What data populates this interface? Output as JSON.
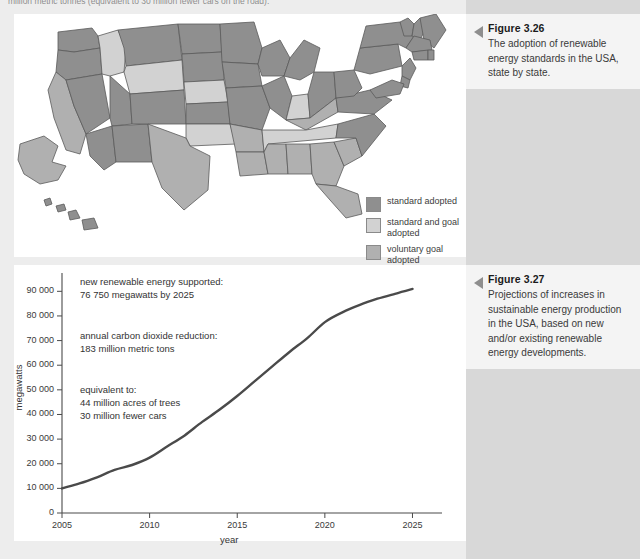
{
  "page": {
    "running_header": "million metric tonnes (equivalent to 30 million fewer cars on the road).",
    "bg_color": "#ededed",
    "sidebar_color": "#d8d8d8"
  },
  "figure_326": {
    "number": "Figure 3.26",
    "caption": "The adoption of renewable energy standards in the USA, state by state.",
    "legend": [
      {
        "label": "standard adopted",
        "color": "#8f8f8f"
      },
      {
        "label": "standard and goal adopted",
        "color": "#d2d2d2"
      },
      {
        "label": "voluntary goal adopted",
        "color": "#b0b0b0"
      }
    ],
    "map_colors": {
      "standard": "#8f8f8f",
      "standard_and_goal": "#d2d2d2",
      "voluntary_goal": "#b0b0b0",
      "outline": "#5a5a5a"
    },
    "states": [
      {
        "code": "WA",
        "category": "standard"
      },
      {
        "code": "OR",
        "category": "standard"
      },
      {
        "code": "CA",
        "category": "voluntary_goal"
      },
      {
        "code": "NV",
        "category": "standard"
      },
      {
        "code": "ID",
        "category": "standard_and_goal"
      },
      {
        "code": "MT",
        "category": "standard"
      },
      {
        "code": "WY",
        "category": "standard_and_goal"
      },
      {
        "code": "UT",
        "category": "standard"
      },
      {
        "code": "AZ",
        "category": "standard"
      },
      {
        "code": "NM",
        "category": "standard"
      },
      {
        "code": "CO",
        "category": "standard"
      },
      {
        "code": "ND",
        "category": "standard"
      },
      {
        "code": "SD",
        "category": "standard"
      },
      {
        "code": "NE",
        "category": "standard_and_goal"
      },
      {
        "code": "KS",
        "category": "standard"
      },
      {
        "code": "OK",
        "category": "standard_and_goal"
      },
      {
        "code": "TX",
        "category": "voluntary_goal"
      },
      {
        "code": "MN",
        "category": "standard"
      },
      {
        "code": "IA",
        "category": "standard"
      },
      {
        "code": "MO",
        "category": "standard"
      },
      {
        "code": "AR",
        "category": "voluntary_goal"
      },
      {
        "code": "LA",
        "category": "voluntary_goal"
      },
      {
        "code": "WI",
        "category": "standard"
      },
      {
        "code": "IL",
        "category": "standard"
      },
      {
        "code": "MI",
        "category": "standard"
      },
      {
        "code": "IN",
        "category": "standard_and_goal"
      },
      {
        "code": "OH",
        "category": "standard"
      },
      {
        "code": "KY",
        "category": "voluntary_goal"
      },
      {
        "code": "TN",
        "category": "standard_and_goal"
      },
      {
        "code": "MS",
        "category": "voluntary_goal"
      },
      {
        "code": "AL",
        "category": "voluntary_goal"
      },
      {
        "code": "GA",
        "category": "voluntary_goal"
      },
      {
        "code": "FL",
        "category": "voluntary_goal"
      },
      {
        "code": "SC",
        "category": "voluntary_goal"
      },
      {
        "code": "NC",
        "category": "standard"
      },
      {
        "code": "VA",
        "category": "standard"
      },
      {
        "code": "WV",
        "category": "standard"
      },
      {
        "code": "PA",
        "category": "standard"
      },
      {
        "code": "NY",
        "category": "standard"
      },
      {
        "code": "VT",
        "category": "standard"
      },
      {
        "code": "NH",
        "category": "standard"
      },
      {
        "code": "ME",
        "category": "standard"
      },
      {
        "code": "MA",
        "category": "standard"
      },
      {
        "code": "CT",
        "category": "standard"
      },
      {
        "code": "RI",
        "category": "standard"
      },
      {
        "code": "NJ",
        "category": "standard"
      },
      {
        "code": "DE",
        "category": "standard"
      },
      {
        "code": "MD",
        "category": "standard"
      },
      {
        "code": "AK",
        "category": "voluntary_goal"
      },
      {
        "code": "HI",
        "category": "standard"
      }
    ]
  },
  "figure_327": {
    "number": "Figure 3.27",
    "caption": "Projections of increases in sustainable energy production in the USA, based on new and/or existing renewable energy developments."
  },
  "chart_data": {
    "type": "line",
    "title": "",
    "xlabel": "year",
    "ylabel": "megawatts",
    "xlim": [
      2005,
      2026
    ],
    "ylim": [
      0,
      95000
    ],
    "xticks": [
      "2005",
      "2010",
      "2015",
      "2020",
      "2025"
    ],
    "xtick_values": [
      2005,
      2010,
      2015,
      2020,
      2025
    ],
    "yticks": [
      "0",
      "10 000",
      "20 000",
      "30 000",
      "40 000",
      "50 000",
      "60 000",
      "70 000",
      "80 000",
      "90 000"
    ],
    "ytick_values": [
      0,
      10000,
      20000,
      30000,
      40000,
      50000,
      60000,
      70000,
      80000,
      90000
    ],
    "grid": false,
    "line_color": "#4a4a4a",
    "series": [
      {
        "name": "new renewable energy supported",
        "x": [
          2005,
          2006,
          2007,
          2008,
          2009,
          2010,
          2011,
          2012,
          2013,
          2014,
          2015,
          2016,
          2017,
          2018,
          2019,
          2020,
          2021,
          2022,
          2023,
          2024,
          2025
        ],
        "values": [
          10000,
          12000,
          14500,
          17500,
          19500,
          22500,
          27000,
          31500,
          37000,
          42000,
          47500,
          53500,
          59500,
          65500,
          71000,
          77500,
          81500,
          84500,
          87000,
          89000,
          91000
        ]
      }
    ],
    "annotations": [
      {
        "lines": [
          "new renewable energy supported:",
          "76 750 megawatts by 2025"
        ]
      },
      {
        "lines": [
          "annual carbon dioxide reduction:",
          "183 million metric tons"
        ]
      },
      {
        "lines": [
          "equivalent to:",
          "44 million acres of trees",
          "30 million fewer cars"
        ]
      }
    ]
  }
}
